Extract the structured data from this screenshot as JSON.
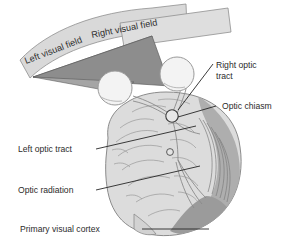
{
  "figure": {
    "background_color": "#ffffff",
    "labels": {
      "left_visual_field": "Left visual field",
      "right_visual_field": "Right visual field",
      "right_optic_tract_line1": "Right optic",
      "right_optic_tract_line2": "tract",
      "optic_chiasm": "Optic chiasm",
      "left_optic_tract": "Left optic tract",
      "optic_radiation": "Optic radiation",
      "primary_visual_cortex": "Primary visual cortex"
    },
    "colors": {
      "band_fill": "#d9d9d9",
      "band_stroke": "#8a8a8a",
      "field_triangle_dark": "#8f8f8f",
      "field_triangle_mid": "#a8a8a8",
      "eye_fill": "#f2f2f2",
      "eye_stroke": "#9a9a9a",
      "brain_fill": "#dcdcdc",
      "brain_stroke": "#8b8b8b",
      "occipital_fill": "#a9a9a9",
      "cortex_dark": "#9a9a9a",
      "leader_line": "#262626",
      "text": "#2b2b2b"
    },
    "parts": [
      "left visual field band",
      "right visual field band",
      "left eye",
      "right eye",
      "optic chiasm",
      "left optic tract",
      "right optic tract",
      "optic radiation",
      "primary visual cortex",
      "brain"
    ]
  }
}
